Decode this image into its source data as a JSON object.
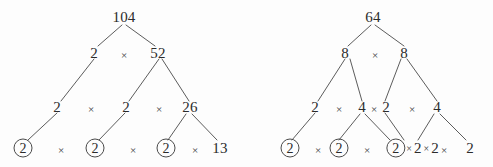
{
  "figure": {
    "kind": "factor-trees",
    "stroke_color": "#4a4a4a",
    "text_color": "#2b2b2b",
    "background": "#fdfdfd",
    "multiplication_symbol": "×"
  },
  "trees": [
    {
      "id": "left-tree",
      "root_value": "104",
      "levels": [
        {
          "level": 0,
          "nodes": [
            {
              "label": "104",
              "circled": false
            }
          ]
        },
        {
          "level": 1,
          "nodes": [
            {
              "label": "2",
              "circled": false
            },
            {
              "label": "52",
              "circled": false
            }
          ]
        },
        {
          "level": 2,
          "nodes": [
            {
              "label": "2",
              "circled": false
            },
            {
              "label": "2",
              "circled": false
            },
            {
              "label": "26",
              "circled": false
            }
          ]
        },
        {
          "level": 3,
          "nodes": [
            {
              "label": "2",
              "circled": true
            },
            {
              "label": "2",
              "circled": true
            },
            {
              "label": "2",
              "circled": true
            },
            {
              "label": "13",
              "circled": false
            }
          ]
        }
      ],
      "prime_factors": [
        "2",
        "2",
        "2",
        "13"
      ]
    },
    {
      "id": "right-tree",
      "root_value": "64",
      "levels": [
        {
          "level": 0,
          "nodes": [
            {
              "label": "64",
              "circled": false
            }
          ]
        },
        {
          "level": 1,
          "nodes": [
            {
              "label": "8",
              "circled": false
            },
            {
              "label": "8",
              "circled": false
            }
          ]
        },
        {
          "level": 2,
          "nodes": [
            {
              "label": "2",
              "circled": false
            },
            {
              "label": "4",
              "circled": false
            },
            {
              "label": "2",
              "circled": false
            },
            {
              "label": "4",
              "circled": false
            }
          ]
        },
        {
          "level": 3,
          "nodes": [
            {
              "label": "2",
              "circled": true
            },
            {
              "label": "2",
              "circled": true
            },
            {
              "label": "2",
              "circled": true
            },
            {
              "label": "2",
              "circled": false
            },
            {
              "label": "2",
              "circled": false
            },
            {
              "label": "2",
              "circled": false
            }
          ]
        }
      ],
      "prime_factors": [
        "2",
        "2",
        "2",
        "2",
        "2",
        "2"
      ]
    }
  ],
  "left": {
    "root": "104",
    "r1": {
      "a": "2",
      "op": "×",
      "b": "52"
    },
    "r2": {
      "a": "2",
      "op1": "×",
      "b": "2",
      "op2": "×",
      "c": "26"
    },
    "r3": {
      "a": "2",
      "op1": "×",
      "b": "2",
      "op2": "×",
      "c": "2",
      "op3": "×",
      "d": "13"
    }
  },
  "right": {
    "root": "64",
    "r1": {
      "a": "8",
      "op": "×",
      "b": "8"
    },
    "r2": {
      "a": "2",
      "op1": "×",
      "b": "4",
      "op2": "×",
      "c": "2",
      "op3": "×",
      "d": "4"
    },
    "r3": {
      "a": "2",
      "op1": "×",
      "b": "2",
      "op2": "×",
      "c": "2",
      "tight_op1": "×",
      "d": "2",
      "tight_op2": "×",
      "e": "2",
      "op3": "×",
      "f": "2"
    }
  }
}
